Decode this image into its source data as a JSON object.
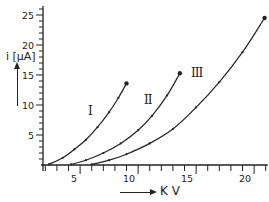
{
  "chart_data": {
    "type": "line",
    "title": "",
    "xlabel": "K V",
    "ylabel": "i [μA]",
    "xlim": [
      1.8,
      21
    ],
    "ylim": [
      0,
      26
    ],
    "grid": false,
    "legend": "none (curves labelled inline with Roman numerals)",
    "x_ticks": [
      5,
      10,
      15,
      20
    ],
    "y_ticks": [
      5,
      10,
      15,
      20,
      25
    ],
    "series": [
      {
        "name": "I",
        "x": [
          2.3,
          3.5,
          4.5,
          5.5,
          6.5,
          7.5,
          8.3,
          9.0
        ],
        "y": [
          0.1,
          1.2,
          2.6,
          4.2,
          6.3,
          8.8,
          11.2,
          13.6
        ]
      },
      {
        "name": "II",
        "x": [
          4.2,
          5.5,
          7.0,
          8.5,
          10.0,
          11.2,
          12.5,
          13.6
        ],
        "y": [
          0.1,
          0.8,
          2.0,
          3.6,
          5.8,
          8.2,
          11.6,
          15.3
        ]
      },
      {
        "name": "III",
        "x": [
          6.0,
          7.5,
          9.0,
          11.0,
          13.0,
          15.0,
          17.0,
          19.0,
          20.9
        ],
        "y": [
          0.1,
          0.8,
          1.8,
          3.6,
          6.0,
          9.6,
          13.8,
          18.8,
          24.5
        ]
      }
    ],
    "annotations": [
      "I",
      "II",
      "III"
    ]
  },
  "axes": {
    "x_label": "K V",
    "y_label": "i [μA]",
    "x_tick_labels": [
      "5",
      "10",
      "15",
      "20"
    ],
    "y_tick_labels": [
      "5",
      "10",
      "15",
      "20",
      "25"
    ]
  },
  "curve_labels": {
    "I": "I",
    "II": "II",
    "III": "III"
  }
}
